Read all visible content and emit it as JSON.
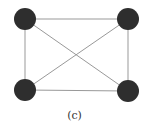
{
  "diagram": {
    "type": "complete-graph-K4",
    "caption": "(c)",
    "node_color": "#2e2e2e",
    "edge_color": "#999999",
    "nodes": [
      {
        "id": "top-left",
        "x": 25,
        "y": 19
      },
      {
        "id": "top-right",
        "x": 128,
        "y": 19
      },
      {
        "id": "bottom-left",
        "x": 25,
        "y": 90
      },
      {
        "id": "bottom-right",
        "x": 128,
        "y": 91
      }
    ],
    "edges": [
      [
        "top-left",
        "top-right"
      ],
      [
        "top-left",
        "bottom-left"
      ],
      [
        "top-left",
        "bottom-right"
      ],
      [
        "top-right",
        "bottom-left"
      ],
      [
        "top-right",
        "bottom-right"
      ],
      [
        "bottom-left",
        "bottom-right"
      ]
    ]
  }
}
